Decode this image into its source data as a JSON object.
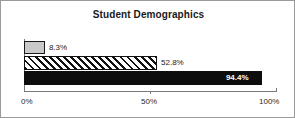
{
  "chart_data": {
    "type": "bar",
    "orientation": "horizontal",
    "title": "Student Demographics",
    "xlabel": "",
    "ylabel": "",
    "categories": [
      "",
      "",
      ""
    ],
    "values": [
      8.3,
      52.8,
      94.4
    ],
    "value_labels": [
      "8.3%",
      "52.8%",
      "94.4%"
    ],
    "xlim": [
      0,
      100
    ],
    "xticks": [
      0,
      50,
      100
    ],
    "xtick_labels": [
      "0%",
      "50%",
      "100%"
    ],
    "grid": false,
    "legend": false,
    "series_styles": [
      "light-gray-fill",
      "diagonal-hatch",
      "solid-black"
    ],
    "colors": {
      "bar_gray": "#c9c9c9",
      "bar_hatch_line": "#111111",
      "bar_black": "#0d0d0d",
      "outline": "#1a1a1a",
      "axis": "#7a7a7a",
      "frame": "#9a9a9a",
      "background": "#ffffff",
      "label_dark": "#1a1a1a",
      "label_light": "#ffffff"
    },
    "bars": [
      {
        "value": 8.3,
        "label": "8.3%",
        "label_position": "outside",
        "style": "light-gray-fill"
      },
      {
        "value": 52.8,
        "label": "52.8%",
        "label_position": "outside",
        "style": "diagonal-hatch"
      },
      {
        "value": 94.4,
        "label": "94.4%",
        "label_position": "inside",
        "style": "solid-black"
      }
    ]
  }
}
